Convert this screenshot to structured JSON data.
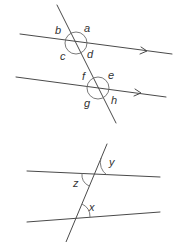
{
  "diagrams": [
    {
      "name": "parallel-lines-angles-a-to-h",
      "description": "Two parallel lines (marked with arrows) cut by a transversal, eight angles labelled",
      "labels": {
        "a": "a",
        "b": "b",
        "c": "c",
        "d": "d",
        "e": "e",
        "f": "f",
        "g": "g",
        "h": "h"
      },
      "parallel_marker": "arrow"
    },
    {
      "name": "parallel-lines-angles-x-y-z",
      "description": "Two lines cut by a transversal with three labelled angles",
      "labels": {
        "x": "x",
        "y": "y",
        "z": "z"
      }
    }
  ],
  "colors": {
    "line": "#4a4a4a",
    "arc": "#6a6a6a",
    "label": "#333333",
    "background": "#ffffff"
  }
}
